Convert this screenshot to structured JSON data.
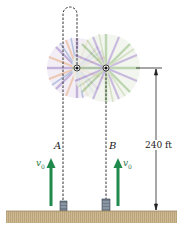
{
  "figure": {
    "labels": {
      "path_a": "A",
      "path_b": "B",
      "height": "240 ft",
      "velocity_a": "v",
      "velocity_a_sub": "0",
      "velocity_b": "v",
      "velocity_b_sub": "0"
    },
    "colors": {
      "arrow": "#1f8a4c",
      "ground": "#c9b48e",
      "ground_dark": "#a8946c",
      "tube": "#6d7a88",
      "burst_a": "#b9a6d6",
      "burst_b": "#a9c79b",
      "burst_orange": "#e6b99a",
      "dashed_line": "#333333"
    }
  }
}
